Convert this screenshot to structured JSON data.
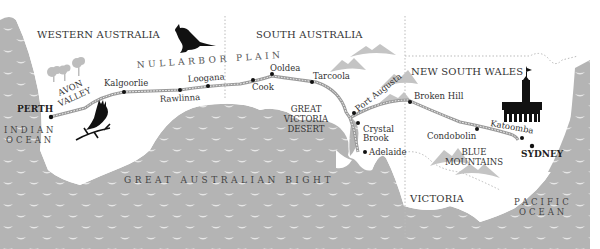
{
  "map": {
    "colors": {
      "sea": "#b4b4b4",
      "land": "#ffffff",
      "wave": "#e6e6e6",
      "mountain": "#c4c4c4",
      "railway": "#9a9a9a",
      "text": "#333333",
      "silhouette": "#111111"
    },
    "states": {
      "western_australia": "WESTERN AUSTRALIA",
      "south_australia": "SOUTH AUSTRALIA",
      "new_south_wales": "NEW SOUTH WALES",
      "victoria": "VICTORIA"
    },
    "regions": {
      "nullarbor_plain": "NULLARBOR PLAIN",
      "avon_valley": [
        "AVON",
        "VALLEY"
      ],
      "great_victoria_desert": [
        "GREAT",
        "VICTORIA",
        "DESERT"
      ],
      "blue_mountains": [
        "BLUE",
        "MOUNTAINS"
      ]
    },
    "water": {
      "indian_ocean": [
        "INDIAN",
        "OCEAN"
      ],
      "great_australian_bight": "GREAT AUSTRALIAN BIGHT",
      "pacific_ocean": [
        "PACIFIC",
        "OCEAN"
      ]
    },
    "cities": {
      "perth": "PERTH",
      "kalgoorlie": "Kalgoorlie",
      "rawlinna": "Rawlinna",
      "loongana": "Loogana",
      "cook": "Cook",
      "ooldea": "Ooldea",
      "tarcoola": "Tarcoola",
      "port_augusta": "Port Augusta",
      "crystal_brook": [
        "Crystal",
        "Brook"
      ],
      "adelaide": "Adelaide",
      "broken_hill": "Broken Hill",
      "condobolin": "Condobolin",
      "katoomba": "Katoomba",
      "sydney": "SYDNEY"
    },
    "icons": [
      "kangaroo-icon",
      "cockatoo-icon",
      "trees-icon",
      "clock-tower-icon",
      "mountain-icon",
      "wave-icon"
    ]
  }
}
